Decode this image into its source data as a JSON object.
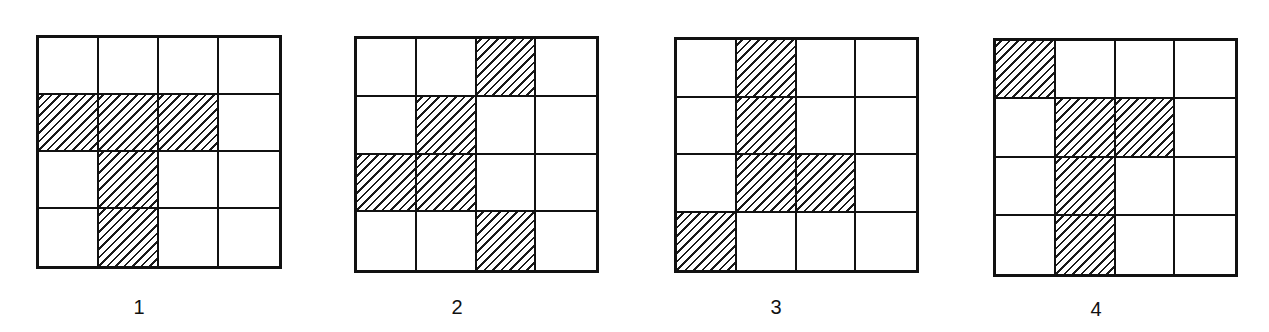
{
  "figures": [
    {
      "label": "1",
      "rows": 4,
      "cols": 4,
      "shaded_cells": [
        [
          1,
          0
        ],
        [
          1,
          1
        ],
        [
          1,
          2
        ],
        [
          2,
          1
        ],
        [
          3,
          1
        ]
      ],
      "box": {
        "x": 36,
        "y": 35,
        "w": 246,
        "h": 234
      },
      "label_pos": {
        "x": 139,
        "y": 296
      }
    },
    {
      "label": "2",
      "rows": 4,
      "cols": 4,
      "shaded_cells": [
        [
          0,
          2
        ],
        [
          1,
          1
        ],
        [
          2,
          0
        ],
        [
          2,
          1
        ],
        [
          3,
          2
        ]
      ],
      "box": {
        "x": 354,
        "y": 36,
        "w": 245,
        "h": 237
      },
      "label_pos": {
        "x": 457,
        "y": 296
      }
    },
    {
      "label": "3",
      "rows": 4,
      "cols": 4,
      "shaded_cells": [
        [
          0,
          1
        ],
        [
          1,
          1
        ],
        [
          2,
          1
        ],
        [
          2,
          2
        ],
        [
          3,
          0
        ]
      ],
      "box": {
        "x": 674,
        "y": 37,
        "w": 245,
        "h": 236
      },
      "label_pos": {
        "x": 776,
        "y": 296
      }
    },
    {
      "label": "4",
      "rows": 4,
      "cols": 4,
      "shaded_cells": [
        [
          0,
          0
        ],
        [
          1,
          1
        ],
        [
          1,
          2
        ],
        [
          2,
          1
        ],
        [
          3,
          1
        ]
      ],
      "box": {
        "x": 993,
        "y": 38,
        "w": 245,
        "h": 239
      },
      "label_pos": {
        "x": 1096,
        "y": 298
      }
    }
  ],
  "colors": {
    "line": "#111111",
    "hatch": "#1a1a1a",
    "background": "#ffffff"
  }
}
